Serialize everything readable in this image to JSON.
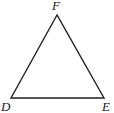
{
  "diagram": {
    "type": "triangle",
    "vertices": [
      {
        "label": "F",
        "x": 57,
        "y": 15,
        "label_x": 52,
        "label_y": 10
      },
      {
        "label": "D",
        "x": 11,
        "y": 98,
        "label_x": 1,
        "label_y": 111
      },
      {
        "label": "E",
        "x": 104,
        "y": 98,
        "label_x": 102,
        "label_y": 111
      }
    ],
    "stroke_color": "#222222",
    "background": "#ffffff"
  }
}
